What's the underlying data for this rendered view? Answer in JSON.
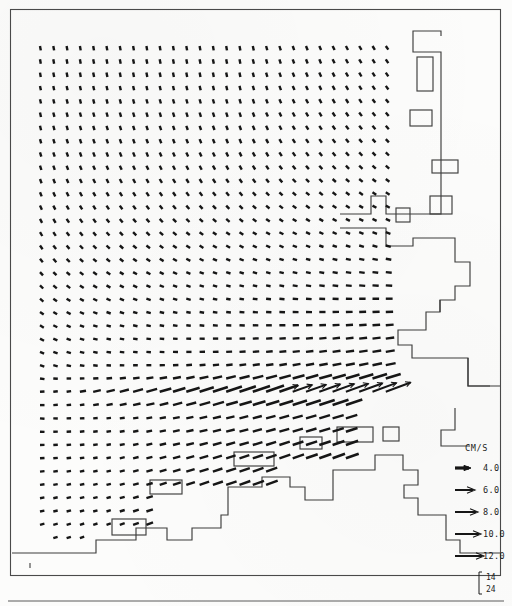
{
  "figure": {
    "type": "vector-field-map",
    "title": "",
    "corner_annotation": {
      "bracket": "[",
      "upper": "14",
      "lower": "24"
    }
  },
  "legend": {
    "units_label": "CM/S",
    "entries": [
      {
        "value": "4.0",
        "speed": 4.0,
        "arrow_length": 14
      },
      {
        "value": "6.0",
        "speed": 6.0,
        "arrow_length": 18
      },
      {
        "value": "8.0",
        "speed": 8.0,
        "arrow_length": 21
      },
      {
        "value": "10.0",
        "speed": 10.0,
        "arrow_length": 24
      },
      {
        "value": "12.0",
        "speed": 12.0,
        "arrow_length": 27
      }
    ]
  },
  "chart_data": {
    "type": "scatter",
    "title": "",
    "xlabel": "",
    "ylabel": "",
    "grid": false,
    "legend_position": "bottom-right",
    "units": "CM/S",
    "vector_grid": {
      "dx": 13.3,
      "dy": 13.3,
      "x0": 40,
      "y0": 46,
      "ncols": 27,
      "nrows": 38
    },
    "speed_range": [
      0.5,
      12.0
    ]
  },
  "colors": {
    "ink": "#161616",
    "line": "#3d3d3d",
    "frame": "#4a4a4a",
    "paper": "#fcfcfb"
  }
}
